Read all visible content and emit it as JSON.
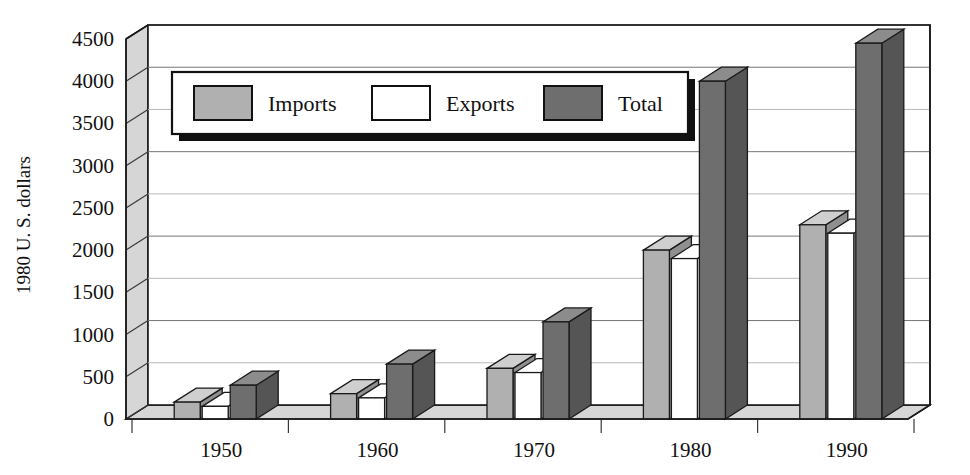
{
  "chart_data": {
    "type": "bar",
    "title": "",
    "subtitle": "",
    "xlabel": "",
    "ylabel": "1980 U. S. dollars",
    "categories": [
      "1950",
      "1960",
      "1970",
      "1980",
      "1990"
    ],
    "series": [
      {
        "name": "Imports",
        "values": [
          200,
          300,
          600,
          2000,
          2300
        ],
        "color": "#b0b0b0"
      },
      {
        "name": "Exports",
        "values": [
          150,
          250,
          550,
          1900,
          2200
        ],
        "color": "#ffffff"
      },
      {
        "name": "Total",
        "values": [
          400,
          650,
          1150,
          4000,
          4450
        ],
        "color": "#6e6e6e"
      }
    ],
    "ylim": [
      0,
      4500
    ],
    "ytick_step": 500,
    "yticks": [
      "0",
      "500",
      "1000",
      "1500",
      "2000",
      "2500",
      "3000",
      "3500",
      "4000",
      "4500"
    ],
    "xticks": [
      "1950",
      "1960",
      "1970",
      "1980",
      "1990"
    ],
    "grid": true,
    "grid_axis": "y",
    "legend": {
      "position": "inside-top-left",
      "entries": [
        "Imports",
        "Exports",
        "Total"
      ]
    },
    "style": "3d-clustered-column",
    "annotations": []
  },
  "axis": {
    "y_label": "1980 U. S. dollars",
    "y_ticks": [
      "4500",
      "4000",
      "3500",
      "3000",
      "2500",
      "2000",
      "1500",
      "1000",
      "500",
      "0"
    ],
    "x_ticks": [
      "1950",
      "1960",
      "1970",
      "1980",
      "1990"
    ]
  },
  "legend": {
    "items": [
      {
        "label": "Imports",
        "swatch": "#b0b0b0"
      },
      {
        "label": "Exports",
        "swatch": "#ffffff"
      },
      {
        "label": "Total",
        "swatch": "#6e6e6e"
      }
    ]
  },
  "colors": {
    "imports_front": "#b0b0b0",
    "imports_top": "#cfcfcf",
    "imports_side": "#8f8f8f",
    "exports_front": "#ffffff",
    "exports_top": "#ffffff",
    "exports_side": "#e8e8e8",
    "total_front": "#6e6e6e",
    "total_top": "#8c8c8c",
    "total_side": "#555555",
    "wall": "#ffffff",
    "side_wall": "#d6d6d6",
    "floor": "#d6d6d6",
    "outline": "#1a1a1a"
  }
}
